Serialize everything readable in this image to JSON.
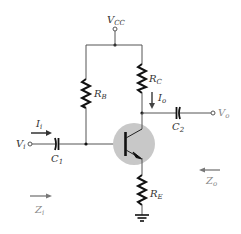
{
  "diagram": {
    "type": "circuit-schematic",
    "colors": {
      "wire": "#555555",
      "component": "#222222",
      "transistor_highlight": "#c8c8c8",
      "arrow_dark": "#333333",
      "arrow_light": "#777777",
      "label": "#333333",
      "label_light": "#888888"
    },
    "labels": {
      "vcc": {
        "main": "V",
        "sub": "CC"
      },
      "rb": {
        "main": "R",
        "sub": "B"
      },
      "rc": {
        "main": "R",
        "sub": "C"
      },
      "re": {
        "main": "R",
        "sub": "E"
      },
      "c1": {
        "main": "C",
        "sub": "1"
      },
      "c2": {
        "main": "C",
        "sub": "2"
      },
      "vi": {
        "main": "V",
        "sub": "i"
      },
      "vo": {
        "main": "V",
        "sub": "o"
      },
      "ii": {
        "main": "I",
        "sub": "i"
      },
      "io": {
        "main": "I",
        "sub": "o"
      },
      "zi": {
        "main": "Z",
        "sub": "i"
      },
      "zo": {
        "main": "Z",
        "sub": "o"
      }
    },
    "components": [
      {
        "id": "RB",
        "kind": "resistor",
        "connects": [
          "VCC",
          "base"
        ]
      },
      {
        "id": "RC",
        "kind": "resistor",
        "connects": [
          "VCC",
          "collector"
        ]
      },
      {
        "id": "RE",
        "kind": "resistor",
        "connects": [
          "emitter",
          "ground"
        ]
      },
      {
        "id": "C1",
        "kind": "capacitor",
        "connects": [
          "Vi",
          "base"
        ]
      },
      {
        "id": "C2",
        "kind": "capacitor",
        "connects": [
          "collector",
          "Vo"
        ]
      },
      {
        "id": "Q",
        "kind": "npn-transistor",
        "highlighted": true
      }
    ]
  }
}
